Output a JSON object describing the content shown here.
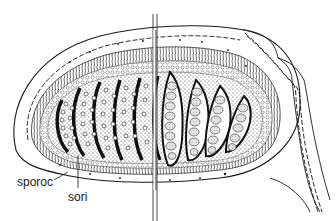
{
  "diagram": {
    "labels": [
      {
        "id": "sporoc",
        "text": "sporoc"
      },
      {
        "id": "sori",
        "text": "sori"
      }
    ],
    "colors": {
      "ink": "#1a1a1a",
      "background": "#ffffff",
      "stipple": "#555555",
      "sporangium_fill": "#d8d8d8"
    }
  }
}
